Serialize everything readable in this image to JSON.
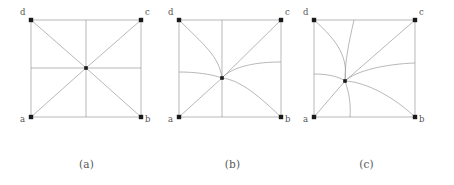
{
  "figure": {
    "type": "diagram",
    "line_color": "#9a9a9a",
    "node_color": "#1a1a1a",
    "label_color": "#555555",
    "caption_color": "#585858",
    "panels": [
      {
        "id": "a",
        "caption": "(a)",
        "square": {
          "x0": 20,
          "y0": 20,
          "x1": 130,
          "y1": 117
        },
        "center": {
          "x": 75,
          "y": 68
        },
        "vertices": [
          {
            "name": "a",
            "label": "a",
            "x": 20,
            "y": 117,
            "label_x": 9,
            "label_y": 118
          },
          {
            "name": "b",
            "label": "b",
            "x": 130,
            "y": 117,
            "label_x": 134,
            "label_y": 118
          },
          {
            "name": "c",
            "label": "c",
            "x": 130,
            "y": 20,
            "label_x": 134,
            "label_y": 8
          },
          {
            "name": "d",
            "label": "d",
            "x": 20,
            "y": 20,
            "label_x": 9,
            "label_y": 8
          }
        ],
        "edges": [
          {
            "from": "a",
            "to": "center",
            "curved": false
          },
          {
            "from": "b",
            "to": "center",
            "curved": false
          },
          {
            "from": "c",
            "to": "center",
            "curved": false
          },
          {
            "from": "d",
            "to": "center",
            "curved": false
          },
          {
            "from": "left-mid",
            "to": "center",
            "curved": false
          },
          {
            "from": "right-mid",
            "to": "center",
            "curved": false
          },
          {
            "from": "top-mid",
            "to": "center",
            "curved": false
          },
          {
            "from": "bottom-mid",
            "to": "center",
            "curved": false
          }
        ]
      },
      {
        "id": "b",
        "caption": "(b)",
        "square": {
          "x0": 22,
          "y0": 20,
          "x1": 124,
          "y1": 117
        },
        "center": {
          "x": 65,
          "y": 78
        },
        "vertices": [
          {
            "name": "a",
            "label": "a",
            "x": 22,
            "y": 117,
            "label_x": 11,
            "label_y": 118
          },
          {
            "name": "b",
            "label": "b",
            "x": 124,
            "y": 117,
            "label_x": 128,
            "label_y": 118
          },
          {
            "name": "c",
            "label": "c",
            "x": 124,
            "y": 20,
            "label_x": 128,
            "label_y": 8
          },
          {
            "name": "d",
            "label": "d",
            "x": 22,
            "y": 20,
            "label_x": 11,
            "label_y": 8
          }
        ],
        "edges": [
          {
            "from": "a",
            "to": "center",
            "curved": false
          },
          {
            "from": "b",
            "to": "center",
            "curved": true
          },
          {
            "from": "c",
            "to": "center",
            "curved": false
          },
          {
            "from": "d",
            "to": "center",
            "curved": true
          },
          {
            "from": "left-mid",
            "to": "center",
            "curved": true
          },
          {
            "from": "right-mid",
            "to": "center",
            "curved": true
          },
          {
            "from": "top-mid",
            "to": "center",
            "curved": false
          },
          {
            "from": "bottom-mid",
            "to": "center",
            "curved": false
          }
        ]
      },
      {
        "id": "c",
        "caption": "(c)",
        "square": {
          "x0": 23,
          "y0": 20,
          "x1": 124,
          "y1": 117
        },
        "center": {
          "x": 54,
          "y": 81
        },
        "vertices": [
          {
            "name": "a",
            "label": "a",
            "x": 23,
            "y": 117,
            "label_x": 12,
            "label_y": 118
          },
          {
            "name": "b",
            "label": "b",
            "x": 124,
            "y": 117,
            "label_x": 128,
            "label_y": 118
          },
          {
            "name": "c",
            "label": "c",
            "x": 124,
            "y": 20,
            "label_x": 128,
            "label_y": 8
          },
          {
            "name": "d",
            "label": "d",
            "x": 23,
            "y": 20,
            "label_x": 12,
            "label_y": 8
          }
        ],
        "edges": [
          {
            "from": "a",
            "to": "center",
            "curved": false
          },
          {
            "from": "b",
            "to": "center",
            "curved": true
          },
          {
            "from": "c",
            "to": "center",
            "curved": false
          },
          {
            "from": "d",
            "to": "center",
            "curved": true
          },
          {
            "from": "left-mid",
            "to": "center",
            "curved": true
          },
          {
            "from": "right-mid",
            "to": "center",
            "curved": true
          },
          {
            "from": "top-mid",
            "to": "center",
            "curved": true
          },
          {
            "from": "bottom-mid",
            "to": "center",
            "curved": true
          }
        ]
      }
    ]
  }
}
